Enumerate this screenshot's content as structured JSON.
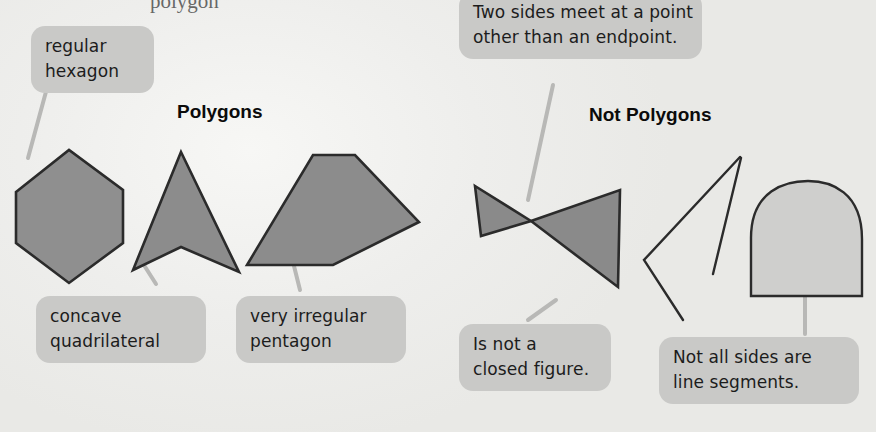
{
  "page": {
    "cut_off_top_text": "polygon",
    "background_color": "#eeeeec",
    "shape_fill_color": "#8c8c8c",
    "shape_outline_color": "#2b2b2b",
    "callout_fill_color": "#c9c9c7",
    "leader_line_color": "#b6b6b4"
  },
  "sections": {
    "polygons": {
      "heading": "Polygons",
      "callouts": [
        {
          "id": "regular-hexagon",
          "lines": [
            "regular",
            "hexagon"
          ]
        },
        {
          "id": "concave-quadrilateral",
          "lines": [
            "concave",
            "quadrilateral"
          ]
        },
        {
          "id": "very-irregular-pentagon",
          "lines": [
            "very irregular",
            "pentagon"
          ]
        }
      ],
      "shapes": [
        {
          "id": "hexagon",
          "name": "regular hexagon",
          "sides": 6,
          "filled": true
        },
        {
          "id": "arrowhead",
          "name": "concave quadrilateral",
          "sides": 4,
          "filled": true
        },
        {
          "id": "pentagon",
          "name": "very irregular pentagon",
          "sides": 5,
          "filled": true
        }
      ]
    },
    "not_polygons": {
      "heading": "Not Polygons",
      "callouts": [
        {
          "id": "two-sides-meet",
          "lines": [
            "Two sides meet at a point",
            "other than an endpoint."
          ]
        },
        {
          "id": "not-closed",
          "lines": [
            "Is not a",
            "closed figure."
          ]
        },
        {
          "id": "not-line-segments",
          "lines": [
            "Not all sides are",
            "line segments."
          ]
        }
      ],
      "shapes": [
        {
          "id": "bowtie",
          "name": "self-intersecting bowtie",
          "filled": true
        },
        {
          "id": "open-figure",
          "name": "open figure with disconnected sides",
          "filled": false
        },
        {
          "id": "dome",
          "name": "dome with curved side",
          "filled": true
        }
      ]
    }
  }
}
